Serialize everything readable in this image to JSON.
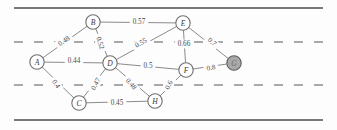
{
  "figure": {
    "width": 337,
    "height": 130,
    "colors": {
      "road_line": "#4c4c4c",
      "lane_dash": "#8d8d8d",
      "edge": "#7d7d7d",
      "node_fill": "#ffffff",
      "node_stroke": "#6f6f6f",
      "node_shaded_fill": "#a9a9a9",
      "text": "#3a3a3a"
    }
  },
  "road": {
    "solid_lines": [
      {
        "name": "top-edge-line",
        "y": 8
      },
      {
        "name": "bottom-edge-line",
        "y": 120
      }
    ],
    "dashed_lines": [
      {
        "name": "upper-lane-divider",
        "y": 42
      },
      {
        "name": "lower-lane-divider",
        "y": 85
      }
    ]
  },
  "graph": {
    "type": "undirected-weighted",
    "nodes": [
      {
        "id": "A",
        "label": "A",
        "x": 37,
        "y": 62,
        "shaded": false
      },
      {
        "id": "B",
        "label": "B",
        "x": 93,
        "y": 22,
        "shaded": false
      },
      {
        "id": "C",
        "label": "C",
        "x": 79,
        "y": 103,
        "shaded": false
      },
      {
        "id": "D",
        "label": "D",
        "x": 110,
        "y": 63,
        "shaded": false
      },
      {
        "id": "E",
        "label": "E",
        "x": 183,
        "y": 23,
        "shaded": false
      },
      {
        "id": "F",
        "label": "F",
        "x": 186,
        "y": 70,
        "shaded": false
      },
      {
        "id": "G",
        "label": "G",
        "x": 234,
        "y": 63,
        "shaded": true
      },
      {
        "id": "H",
        "label": "H",
        "x": 155,
        "y": 101,
        "shaded": false
      }
    ],
    "edges": [
      {
        "source": "A",
        "target": "B",
        "weight": "0.48",
        "lx": 64,
        "ly": 41,
        "rot": -34
      },
      {
        "source": "A",
        "target": "D",
        "weight": "0.44",
        "lx": 74,
        "ly": 61,
        "rot": 0
      },
      {
        "source": "A",
        "target": "C",
        "weight": "0.4",
        "lx": 56,
        "ly": 84,
        "rot": 56
      },
      {
        "source": "B",
        "target": "E",
        "weight": "0.57",
        "lx": 139,
        "ly": 22,
        "rot": 0
      },
      {
        "source": "B",
        "target": "D",
        "weight": "0.52",
        "lx": 100,
        "ly": 43,
        "rot": 72
      },
      {
        "source": "C",
        "target": "D",
        "weight": "0.47",
        "lx": 96,
        "ly": 84,
        "rot": -62
      },
      {
        "source": "C",
        "target": "H",
        "weight": "0.45",
        "lx": 117,
        "ly": 103,
        "rot": 0
      },
      {
        "source": "D",
        "target": "E",
        "weight": "0.55",
        "lx": 141,
        "ly": 43,
        "rot": -29
      },
      {
        "source": "D",
        "target": "F",
        "weight": "0.5",
        "lx": 148,
        "ly": 66,
        "rot": 0
      },
      {
        "source": "D",
        "target": "H",
        "weight": "0.48",
        "lx": 131,
        "ly": 84,
        "rot": 51
      },
      {
        "source": "E",
        "target": "F",
        "weight": "0.66",
        "lx": 184,
        "ly": 44,
        "rot": 0
      },
      {
        "source": "E",
        "target": "G",
        "weight": "0.7",
        "lx": 212,
        "ly": 42,
        "rot": 42
      },
      {
        "source": "F",
        "target": "G",
        "weight": "0.8",
        "lx": 211,
        "ly": 68,
        "rot": -10
      },
      {
        "source": "F",
        "target": "H",
        "weight": "0.6",
        "lx": 169,
        "ly": 85,
        "rot": -62
      }
    ]
  }
}
